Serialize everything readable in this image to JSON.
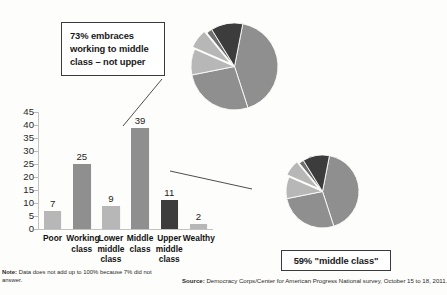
{
  "callouts": {
    "top": "73% embraces working to middle class – not upper",
    "bottom": "59% \"middle class\""
  },
  "footnotes": {
    "note_label": "Note:",
    "note_text": " Data does not add up to 100% because 7% did not answer.",
    "source_label": "Source:",
    "source_text": " Democracy Corps/Center for American Progress National survey, October 15 to 18, 2011."
  },
  "colors": {
    "light_gray": "#b7b7b7",
    "medium_gray": "#8f8f8f",
    "dark_gray": "#3c3c3c",
    "axis": "#c2c2c2",
    "border": "#3a3a3a",
    "background": "#fdfdfb"
  },
  "chart_data": {
    "type": "bar",
    "title": "",
    "xlabel": "",
    "ylabel": "",
    "ylim": [
      0,
      45
    ],
    "yticks": [
      0,
      5,
      10,
      15,
      20,
      25,
      30,
      35,
      40,
      45
    ],
    "grid": false,
    "legend": "none",
    "categories": [
      "Poor",
      "Working class",
      "Lower middle class",
      "Middle class",
      "Upper middle class",
      "Wealthy"
    ],
    "category_lines": [
      [
        "Poor"
      ],
      [
        "Working",
        "class"
      ],
      [
        "Lower",
        "middle",
        "class"
      ],
      [
        "Middle",
        "class"
      ],
      [
        "Upper",
        "middle",
        "class"
      ],
      [
        "Wealthy"
      ]
    ],
    "values": [
      7,
      25,
      9,
      39,
      11,
      2
    ],
    "bar_colors": [
      "#b7b7b7",
      "#8f8f8f",
      "#b7b7b7",
      "#8f8f8f",
      "#3c3c3c",
      "#b7b7b7"
    ],
    "note": "Data does not add up to 100% because 7% did not answer.",
    "source": "Democracy Corps/Center for American Progress National survey, October 15 to 18, 2011."
  },
  "pies": [
    {
      "name": "top-pie",
      "label": "73% embraces working to middle class – not upper",
      "exploded_index": 3,
      "slices": [
        {
          "label": "Middle class",
          "value": 39,
          "color": "#8f8f8f"
        },
        {
          "label": "Working class",
          "value": 25,
          "color": "#8f8f8f"
        },
        {
          "label": "Lower middle class",
          "value": 9,
          "color": "#b7b7b7"
        },
        {
          "label": "Poor",
          "value": 7,
          "color": "#b7b7b7"
        },
        {
          "label": "Wealthy",
          "value": 2,
          "color": "#6f6f6f"
        },
        {
          "label": "Upper middle class",
          "value": 11,
          "color": "#3c3c3c"
        }
      ]
    },
    {
      "name": "bottom-pie",
      "label": "59% \"middle class\"",
      "exploded_index": 3,
      "slices": [
        {
          "label": "Middle class",
          "value": 39,
          "color": "#8f8f8f"
        },
        {
          "label": "Working class",
          "value": 25,
          "color": "#8f8f8f"
        },
        {
          "label": "Lower middle class",
          "value": 9,
          "color": "#b7b7b7"
        },
        {
          "label": "Poor",
          "value": 7,
          "color": "#b7b7b7"
        },
        {
          "label": "Wealthy",
          "value": 2,
          "color": "#6f6f6f"
        },
        {
          "label": "Upper middle class",
          "value": 11,
          "color": "#3c3c3c"
        }
      ]
    }
  ]
}
